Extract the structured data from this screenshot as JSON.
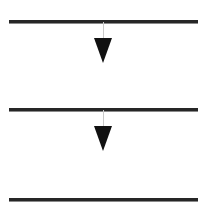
{
  "figure": {
    "title": "Downward arrows between horizontal lines",
    "background_color": "#ffffff",
    "width": 205,
    "height": 216,
    "line_color": "#262626",
    "line_highlight_color": "#8a8a8a",
    "arrow_color": "#111111",
    "stem_color": "#c9c9c9"
  },
  "lines": [
    {
      "name": "top-line",
      "label": "Line 1",
      "x": 9,
      "y": 20,
      "width": 189,
      "thickness": 3
    },
    {
      "name": "middle-line",
      "label": "Line 2",
      "x": 9,
      "y": 108,
      "width": 189,
      "thickness": 3
    },
    {
      "name": "bottom-line",
      "label": "Line 3",
      "x": 9,
      "y": 198,
      "width": 189,
      "thickness": 3
    }
  ],
  "arrows": [
    {
      "name": "arrow-1",
      "label": "Arrow 1",
      "direction": "down",
      "stem_x": 103,
      "stem_top": 22,
      "stem_height": 16,
      "head_center_x": 103,
      "head_top": 38,
      "head_width": 18,
      "head_height": 25
    },
    {
      "name": "arrow-2",
      "label": "Arrow 2",
      "direction": "down",
      "stem_x": 103,
      "stem_top": 110,
      "stem_height": 16,
      "head_center_x": 103,
      "head_top": 126,
      "head_width": 18,
      "head_height": 25
    }
  ]
}
